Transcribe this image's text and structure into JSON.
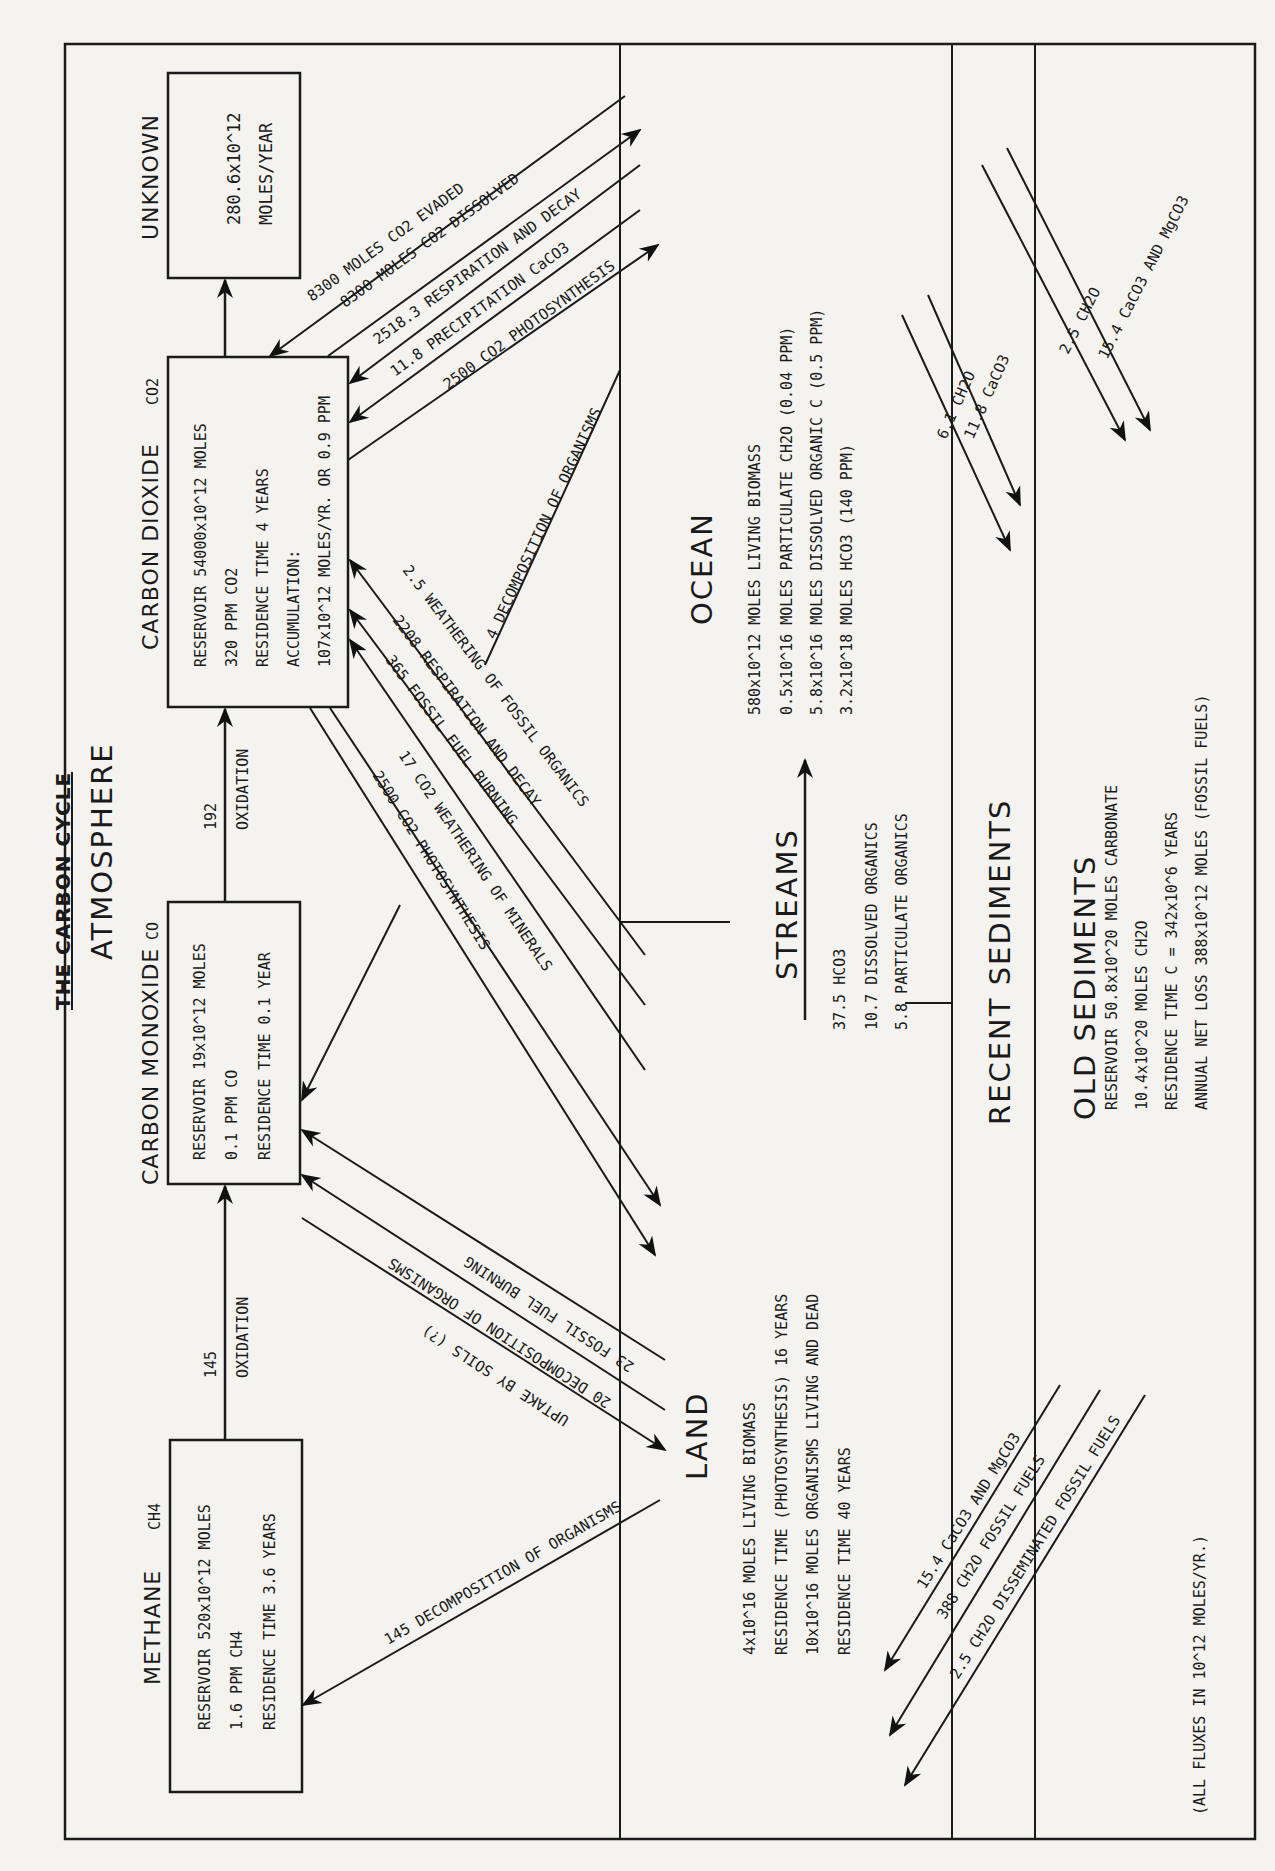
{
  "title": "THE CARBON CYCLE",
  "sections": {
    "atmosphere": "ATMOSPHERE",
    "land": "LAND",
    "ocean": "OCEAN",
    "streams": "STREAMS",
    "recent_sediments": "RECENT SEDIMENTS",
    "old_sediments": "OLD SEDIMENTS"
  },
  "reservoirs": {
    "unknown": {
      "label": "UNKNOWN",
      "lines": [
        "280.6x10^12",
        "MOLES/YEAR"
      ]
    },
    "co2": {
      "label": "CARBON DIOXIDE",
      "formula": "CO2",
      "lines": [
        "RESERVOIR 54000x10^12 MOLES",
        "320 PPM CO2",
        "RESIDENCE TIME 4 YEARS",
        "ACCUMULATION:",
        "107x10^12 MOLES/YR. OR 0.9 PPM"
      ]
    },
    "co": {
      "label": "CARBON MONOXIDE",
      "formula": "CO",
      "lines": [
        "RESERVOIR 19x10^12 MOLES",
        "0.1 PPM CO",
        "RESIDENCE TIME 0.1 YEAR"
      ]
    },
    "methane": {
      "label": "METHANE",
      "formula": "CH4",
      "lines": [
        "RESERVOIR 520x10^12 MOLES",
        "1.6 PPM CH4",
        "RESIDENCE TIME 3.6 YEARS"
      ]
    },
    "land": {
      "lines": [
        "4x10^16 MOLES LIVING BIOMASS",
        "RESIDENCE TIME (PHOTOSYNTHESIS) 16 YEARS",
        "10x10^16 MOLES ORGANISMS LIVING AND DEAD",
        "RESIDENCE TIME 40 YEARS"
      ]
    },
    "ocean": {
      "lines": [
        "580x10^12 MOLES LIVING BIOMASS",
        "0.5x10^16 MOLES PARTICULATE CH2O (0.04 PPM)",
        "5.8x10^16 MOLES DISSOLVED ORGANIC C (0.5 PPM)",
        "3.2x10^18 MOLES HCO3 (140 PPM)"
      ]
    },
    "streams": {
      "lines": [
        "37.5 HCO3",
        "10.7 DISSOLVED ORGANICS",
        "5.8 PARTICULATE ORGANICS"
      ]
    },
    "old_sediments": {
      "lines": [
        "RESERVOIR 50.8x10^20 MOLES CARBONATE",
        "10.4x10^20 MOLES CH2O",
        "RESIDENCE TIME C = 342x10^6 YEARS",
        "ANNUAL NET LOSS 388x10^12 MOLES (FOSSIL FUELS)"
      ]
    }
  },
  "fluxes": {
    "ch4_to_co": {
      "value": "145",
      "label": "OXIDATION"
    },
    "co_to_co2": {
      "value": "192",
      "label": "OXIDATION"
    },
    "co2_evaded": "8300 MOLES CO2 EVADED",
    "co2_dissolved": "8300 MOLES CO2 DISSOLVED",
    "ocean_respiration": "2518.3 RESPIRATION AND DECAY",
    "precipitation_caco3": "11.8 PRECIPITATION CaCO3",
    "ocean_photosynthesis": "2500 CO2 PHOTOSYNTHESIS",
    "ocean_decomposition": "4 DECOMPOSITION OF ORGANISMS",
    "weathering_fossil": "2.5 WEATHERING OF FOSSIL ORGANICS",
    "land_respiration": "2208 RESPIRATION AND DECAY",
    "fossil_fuel_co2": "365 FOSSIL FUEL BURNING",
    "weathering_minerals": "17 CO2 WEATHERING OF MINERALS",
    "land_photosynthesis": "2500 CO2 PHOTOSYNTHESIS",
    "fossil_fuel_co": "23 FOSSIL FUEL BURNING",
    "decomposition_co": "20 DECOMPOSITION OF ORGANISMS",
    "uptake_soils": "UPTAKE BY SOILS (?)",
    "decomposition_ch4": "145 DECOMPOSITION OF ORGANISMS",
    "ocean_sed_ch2o": "6.1 CH2O",
    "ocean_sed_caco3": "11.8 CaCO3",
    "old_sed_ch2o": "2.5 CH2O",
    "old_sed_caco3": "15.4 CaCO3 AND MgCO3",
    "land_caco3": "15.4 CaCO3 AND MgCO3",
    "fossil_fuels": "388 CH2O FOSSIL FUELS",
    "disseminated": "2.5 CH2O DISSEMINATED FOSSIL FUELS"
  },
  "footnote": "(ALL FLUXES IN 10^12 MOLES/YR.)"
}
